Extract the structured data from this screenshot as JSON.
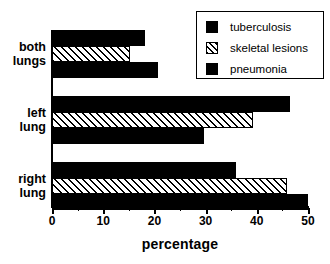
{
  "chart_data": {
    "type": "bar",
    "orientation": "horizontal",
    "title": "",
    "xlabel": "percentage",
    "ylabel": "",
    "xlim": [
      0,
      50
    ],
    "ylim": [],
    "grid": false,
    "legend_position": "top-right",
    "categories": [
      "both lungs",
      "left lung",
      "right lung"
    ],
    "category_lines": [
      [
        "both",
        "lungs"
      ],
      [
        "left",
        "lung"
      ],
      [
        "right",
        "lung"
      ]
    ],
    "x_ticks": [
      0,
      10,
      20,
      30,
      40,
      50
    ],
    "x_tick_labels": [
      "0",
      "10",
      "20",
      "30",
      "40",
      "50"
    ],
    "x_minor_ticks": [
      5,
      15,
      25,
      35,
      45
    ],
    "series": [
      {
        "name": "tuberculosis",
        "fill": "solid",
        "color": "#000000",
        "values": [
          18.2,
          46.5,
          35.9
        ]
      },
      {
        "name": "skeletal lesions",
        "fill": "hatched",
        "color": "#000000",
        "values": [
          15.2,
          39.3,
          45.9
        ]
      },
      {
        "name": "pneumonia",
        "fill": "solid",
        "color": "#000000",
        "values": [
          20.7,
          29.7,
          50.0
        ]
      }
    ],
    "legend_entries": [
      "tuberculosis",
      "skeletal lesions",
      "pneumonia"
    ]
  },
  "axis": {
    "x_title": "percentage"
  }
}
